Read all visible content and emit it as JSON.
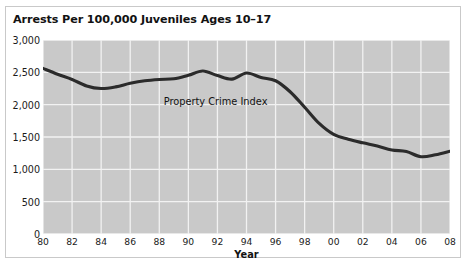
{
  "chart_data": {
    "type": "line",
    "title": "Arrests Per 100,000 Juveniles Ages 10–17",
    "xlabel": "Year",
    "ylabel": "",
    "xlim": [
      1980,
      2008
    ],
    "ylim": [
      0,
      3000
    ],
    "grid": true,
    "legend": "none",
    "annotations": [
      {
        "text": "Property Crime Index",
        "x": 1988.3,
        "y": 2130
      }
    ],
    "ytick_labels": [
      "0",
      "500",
      "1,000",
      "1,500",
      "2,000",
      "2,500",
      "3,000"
    ],
    "ytick_values": [
      0,
      500,
      1000,
      1500,
      2000,
      2500,
      3000
    ],
    "xtick_labels": [
      "80",
      "82",
      "84",
      "86",
      "88",
      "90",
      "92",
      "94",
      "96",
      "98",
      "00",
      "02",
      "04",
      "06",
      "08"
    ],
    "xtick_values": [
      1980,
      1982,
      1984,
      1986,
      1988,
      1990,
      1992,
      1994,
      1996,
      1998,
      2000,
      2002,
      2004,
      2006,
      2008
    ],
    "series": [
      {
        "name": "Property Crime Index",
        "color": "#2b2b2b",
        "x": [
          1980,
          1981,
          1982,
          1983,
          1984,
          1985,
          1986,
          1987,
          1988,
          1989,
          1990,
          1991,
          1992,
          1993,
          1994,
          1995,
          1996,
          1997,
          1998,
          1999,
          2000,
          2001,
          2002,
          2003,
          2004,
          2005,
          2006,
          2007,
          2008
        ],
        "values": [
          2560,
          2470,
          2390,
          2290,
          2250,
          2275,
          2330,
          2370,
          2390,
          2400,
          2455,
          2520,
          2450,
          2395,
          2490,
          2420,
          2370,
          2200,
          1960,
          1710,
          1540,
          1465,
          1410,
          1360,
          1300,
          1275,
          1195,
          1225,
          1280
        ]
      }
    ]
  },
  "colors": {
    "plot_background": "#c9c9c9",
    "gridline": "#f2f2f2",
    "line": "#2b2b2b",
    "frame_border": "#c9c9c9",
    "text": "#121212"
  }
}
